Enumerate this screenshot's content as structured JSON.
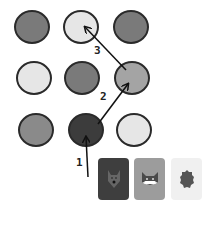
{
  "board": {
    "circles": [
      {
        "id": "r1c1",
        "cx": 32,
        "cy": 28,
        "r": 18,
        "fill": "#7a7a7a"
      },
      {
        "id": "r1c2",
        "cx": 81,
        "cy": 28,
        "r": 18,
        "fill": "#e6e6e6"
      },
      {
        "id": "r1c3",
        "cx": 131,
        "cy": 28,
        "r": 18,
        "fill": "#7a7a7a"
      },
      {
        "id": "r2c1",
        "cx": 34,
        "cy": 79,
        "r": 18,
        "fill": "#e6e6e6"
      },
      {
        "id": "r2c2",
        "cx": 82,
        "cy": 79,
        "r": 18,
        "fill": "#7a7a7a"
      },
      {
        "id": "r2c3",
        "cx": 132,
        "cy": 79,
        "r": 18,
        "fill": "#a4a4a4"
      },
      {
        "id": "r3c1",
        "cx": 36,
        "cy": 131,
        "r": 18,
        "fill": "#8a8a8a"
      },
      {
        "id": "r3c2",
        "cx": 86,
        "cy": 131,
        "r": 18,
        "fill": "#3c3c3c"
      },
      {
        "id": "r3c3",
        "cx": 134,
        "cy": 131,
        "r": 18,
        "fill": "#e6e6e6"
      }
    ],
    "arrows": [
      {
        "label": "1",
        "x1": 88,
        "y1": 177,
        "x2": 86,
        "y2": 137,
        "lx": 76,
        "ly": 156
      },
      {
        "label": "2",
        "x1": 98,
        "y1": 124,
        "x2": 128,
        "y2": 84,
        "lx": 100,
        "ly": 90
      },
      {
        "label": "3",
        "x1": 126,
        "y1": 70,
        "x2": 85,
        "y2": 27,
        "lx": 94,
        "ly": 44
      }
    ]
  },
  "cards": [
    {
      "name": "wolf",
      "x": 98,
      "y": 158,
      "bg": "#3e3e3e",
      "icon": "wolf-icon"
    },
    {
      "name": "cat",
      "x": 134,
      "y": 158,
      "bg": "#9c9c9c",
      "icon": "cat-face-icon"
    },
    {
      "name": "hedgehog",
      "x": 171,
      "y": 158,
      "bg": "#f0f0f0",
      "icon": "hedgehog-icon"
    }
  ],
  "labels": {
    "step1": "1",
    "step2": "2",
    "step3": "3"
  }
}
